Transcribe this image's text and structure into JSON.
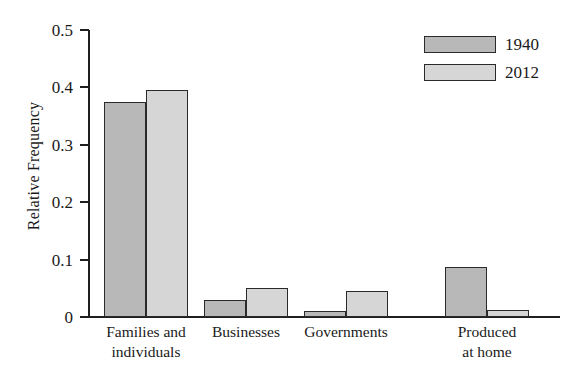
{
  "chart_data": {
    "type": "bar",
    "title": "",
    "xlabel": "",
    "ylabel": "Relative Frequency",
    "ylim": [
      0,
      0.5
    ],
    "ytick_labels": [
      "0.5",
      "0.4",
      "0.3",
      "0.2",
      "0.1",
      "0"
    ],
    "ytick_values": [
      0.5,
      0.4,
      0.3,
      0.2,
      0.1,
      0
    ],
    "grid": false,
    "legend_position": "top-right",
    "categories": [
      "Families and\nindividuals",
      "Businesses",
      "Governments",
      "Produced\nat home"
    ],
    "series": [
      {
        "name": "1940",
        "color": "#b8b8b8",
        "values": [
          0.375,
          0.03,
          0.011,
          0.088
        ]
      },
      {
        "name": "2012",
        "color": "#d6d6d6",
        "values": [
          0.395,
          0.051,
          0.046,
          0.012
        ]
      }
    ]
  },
  "legend": {
    "entries": [
      {
        "label": "1940"
      },
      {
        "label": "2012"
      }
    ]
  },
  "colors": {
    "axis": "#1f1f1f",
    "bar_outline": "#2a2a2a",
    "background": "#ffffff"
  }
}
